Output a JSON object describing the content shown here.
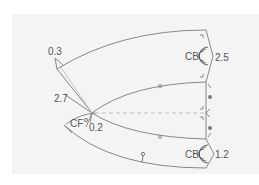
{
  "diagram": {
    "type": "sewing-pattern-draft",
    "labels": {
      "top_left_measure": "0.3",
      "left_measure": "2.7",
      "center_front": "CF",
      "center_front_measure": "0.2",
      "top_center_back": "CB",
      "top_center_back_measure": "2.5",
      "bottom_center_back": "CB",
      "bottom_center_back_measure": "1.2"
    },
    "colors": {
      "line": "#7a7a7a",
      "light_line": "#b8b8b8",
      "text": "#555555",
      "background": "#f4f4f4"
    }
  }
}
